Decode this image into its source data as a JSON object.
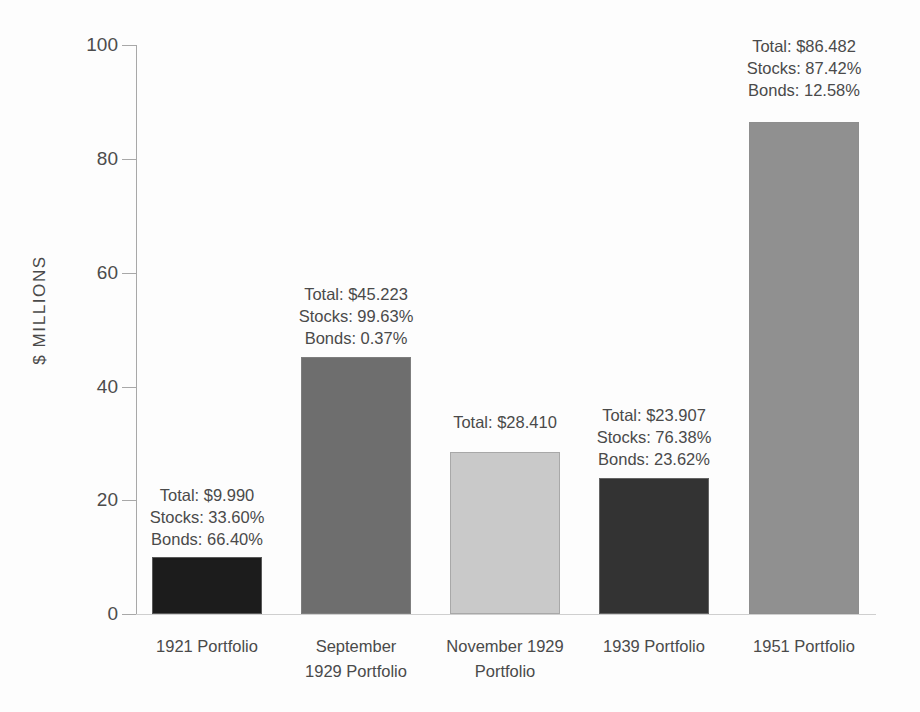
{
  "chart_data": {
    "type": "bar",
    "title": "",
    "subtitle": "",
    "xlabel": "",
    "ylabel": "$ MILLIONS",
    "ylim": [
      0,
      100
    ],
    "yticks": [
      0,
      20,
      40,
      60,
      80,
      100
    ],
    "ytick_labels": [
      "0",
      "20",
      "40",
      "60",
      "80",
      "100"
    ],
    "grid": false,
    "legend": null,
    "categories": [
      "1921 Portfolio",
      "September 1929 Portfolio",
      "November 1929 Portfolio",
      "1939 Portfolio",
      "1951 Portfolio"
    ],
    "category_lines": [
      [
        "1921 Portfolio"
      ],
      [
        "September",
        "1929 Portfolio"
      ],
      [
        "November 1929",
        "Portfolio"
      ],
      [
        "1939 Portfolio"
      ],
      [
        "1951 Portfolio"
      ]
    ],
    "values": [
      9.99,
      45.223,
      28.41,
      23.907,
      86.482
    ],
    "bar_colors": [
      "#1c1c1c",
      "#6e6e6e",
      "#c9c9c9",
      "#333333",
      "#909090"
    ],
    "annotations": [
      [
        "Total: $9.990",
        "Stocks: 33.60%",
        "Bonds: 66.40%"
      ],
      [
        "Total: $45.223",
        "Stocks: 99.63%",
        "Bonds: 0.37%"
      ],
      [
        "Total: $28.410"
      ],
      [
        "Total: $23.907",
        "Stocks: 76.38%",
        "Bonds: 23.62%"
      ],
      [
        "Total: $86.482",
        "Stocks: 87.42%",
        "Bonds: 12.58%"
      ]
    ],
    "series_detail": [
      {
        "category": "1921 Portfolio",
        "total": 9.99,
        "stocks_pct": 33.6,
        "bonds_pct": 66.4
      },
      {
        "category": "September 1929 Portfolio",
        "total": 45.223,
        "stocks_pct": 99.63,
        "bonds_pct": 0.37
      },
      {
        "category": "November 1929 Portfolio",
        "total": 28.41,
        "stocks_pct": null,
        "bonds_pct": null
      },
      {
        "category": "1939 Portfolio",
        "total": 23.907,
        "stocks_pct": 76.38,
        "bonds_pct": 23.62
      },
      {
        "category": "1951 Portfolio",
        "total": 86.482,
        "stocks_pct": 87.42,
        "bonds_pct": 12.58
      }
    ]
  },
  "axis": {
    "tick_0": "0",
    "tick_20": "20",
    "tick_40": "40",
    "tick_60": "60",
    "tick_80": "80",
    "tick_100": "100"
  },
  "annotations_flat": {
    "b0_l0": "Total: $9.990",
    "b0_l1": "Stocks: 33.60%",
    "b0_l2": "Bonds: 66.40%",
    "b1_l0": "Total: $45.223",
    "b1_l1": "Stocks: 99.63%",
    "b1_l2": "Bonds: 0.37%",
    "b2_l0": "Total: $28.410",
    "b3_l0": "Total: $23.907",
    "b3_l1": "Stocks: 76.38%",
    "b3_l2": "Bonds: 23.62%",
    "b4_l0": "Total: $86.482",
    "b4_l1": "Stocks: 87.42%",
    "b4_l2": "Bonds: 12.58%"
  },
  "xlabels_flat": {
    "c0_l0": "1921 Portfolio",
    "c1_l0": "September",
    "c1_l1": "1929 Portfolio",
    "c2_l0": "November 1929",
    "c2_l1": "Portfolio",
    "c3_l0": "1939 Portfolio",
    "c4_l0": "1951 Portfolio"
  }
}
